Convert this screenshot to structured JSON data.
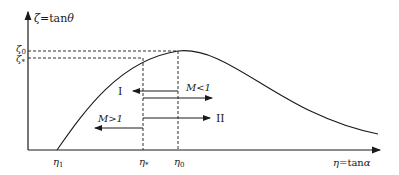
{
  "diagram": {
    "y_axis_label": "ζ = tanθ",
    "x_axis_label": "η = tanα",
    "y_ticks": [
      {
        "label": "ζ",
        "sub": "0",
        "y": 51
      },
      {
        "label": "ζ",
        "sub": "*",
        "y": 58
      }
    ],
    "x_ticks": [
      {
        "label": "η",
        "sub": "1",
        "x": 57
      },
      {
        "label": "η",
        "sub": "*",
        "x": 143
      },
      {
        "label": "η",
        "sub": "0",
        "x": 178
      }
    ],
    "arrows": [
      {
        "id": "upper-left",
        "label": "I",
        "direction": "left"
      },
      {
        "id": "upper-right",
        "label": "M<1",
        "direction": "right"
      },
      {
        "id": "lower-left",
        "label": "M>1",
        "direction": "left"
      },
      {
        "id": "lower-right",
        "label": "II",
        "direction": "right"
      }
    ],
    "colors": {
      "line": "#1a1a1a",
      "background": "#ffffff"
    }
  }
}
